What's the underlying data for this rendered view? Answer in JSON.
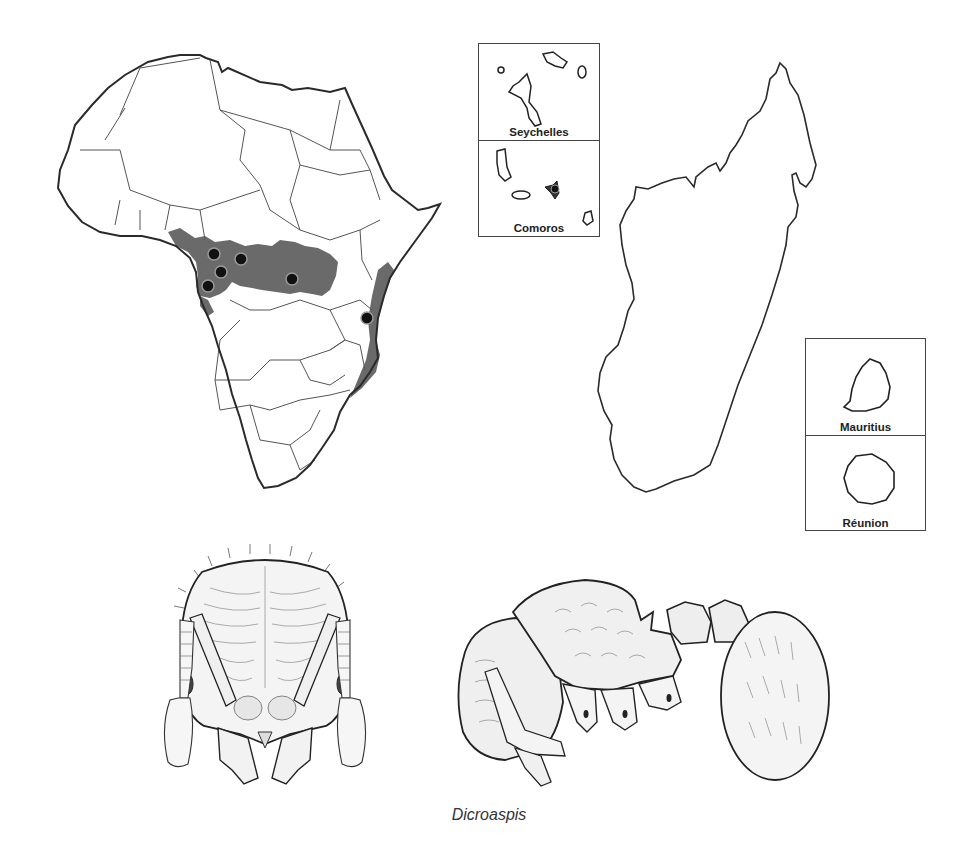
{
  "figure": {
    "caption": "Dicroaspis",
    "colors": {
      "outline": "#2a2a2a",
      "border": "#555555",
      "range_fill": "#6a6a6a",
      "record_dot": "#111111",
      "record_ring": "#9a9a9a",
      "background": "#ffffff"
    }
  },
  "maps": {
    "africa": {
      "label": "Africa distribution map",
      "range": "Central African rainforest belt and East African coast",
      "records_count": 6
    },
    "madagascar": {
      "label": "Madagascar"
    },
    "insets": [
      {
        "name": "Seychelles"
      },
      {
        "name": "Comoros"
      },
      {
        "name": "Mauritius"
      },
      {
        "name": "Réunion"
      }
    ]
  },
  "illustrations": [
    {
      "view": "head, full-face view"
    },
    {
      "view": "body, lateral view"
    }
  ]
}
